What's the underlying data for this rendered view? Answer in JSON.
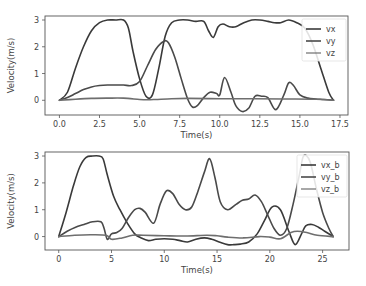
{
  "colors": {
    "vx": "#3a3a3a",
    "vy": "#4a4a4a",
    "vz": "#6e6e6e",
    "spine": "#555555",
    "text": "#444444"
  },
  "chart_data": [
    {
      "type": "line",
      "title": "",
      "xlabel": "Time(s)",
      "ylabel": "Velocity(m/s)",
      "xlim": [
        -0.9,
        18.0
      ],
      "ylim": [
        -0.55,
        3.15
      ],
      "xticks": [
        0.0,
        2.5,
        5.0,
        7.5,
        10.0,
        12.5,
        15.0,
        17.5
      ],
      "xtick_labels": [
        "0.0",
        "2.5",
        "5.0",
        "7.5",
        "10.0",
        "12.5",
        "15.0",
        "17.5"
      ],
      "yticks": [
        0,
        1,
        2,
        3
      ],
      "ytick_labels": [
        "0",
        "1",
        "2",
        "3"
      ],
      "grid": false,
      "legend_position": "upper right",
      "frame": {
        "left": 45,
        "top": 16,
        "right": 348,
        "bottom": 115
      },
      "series": [
        {
          "name": "vx",
          "x": [
            0,
            0.5,
            1.0,
            1.5,
            2.0,
            2.5,
            3.0,
            3.5,
            4.0,
            4.3,
            4.6,
            5.0,
            5.4,
            5.8,
            6.2,
            6.6,
            7.0,
            7.5,
            8.0,
            8.5,
            9.0,
            9.3,
            9.6,
            9.9,
            10.2,
            10.6,
            11.0,
            11.5,
            12.0,
            12.5,
            13.0,
            13.4,
            13.8,
            14.3,
            14.8,
            15.3,
            15.8,
            16.3,
            16.8,
            17.1
          ],
          "values": [
            0,
            0.3,
            1.2,
            2.0,
            2.6,
            2.9,
            3.0,
            3.0,
            3.0,
            2.7,
            1.8,
            0.8,
            0.15,
            0.2,
            1.2,
            2.4,
            2.9,
            3.0,
            3.0,
            2.95,
            2.95,
            2.6,
            2.35,
            2.75,
            2.85,
            2.75,
            2.75,
            2.9,
            3.0,
            3.0,
            2.95,
            2.9,
            2.9,
            3.0,
            2.9,
            2.7,
            2.1,
            1.2,
            0.3,
            0
          ]
        },
        {
          "name": "vy",
          "x": [
            0,
            0.5,
            1.0,
            1.5,
            2.0,
            2.5,
            3.0,
            3.5,
            4.0,
            4.5,
            5.0,
            5.5,
            6.0,
            6.5,
            6.8,
            7.2,
            7.6,
            8.0,
            8.3,
            8.6,
            9.0,
            9.4,
            9.8,
            10.0,
            10.3,
            10.7,
            11.0,
            11.4,
            11.8,
            12.2,
            12.6,
            13.0,
            13.5,
            14.0,
            14.3,
            14.6,
            15.0,
            15.5,
            16.0,
            16.5,
            17.1
          ],
          "values": [
            0,
            0.1,
            0.25,
            0.4,
            0.5,
            0.55,
            0.57,
            0.57,
            0.57,
            0.55,
            0.7,
            1.3,
            1.9,
            2.2,
            2.15,
            1.6,
            0.8,
            0.05,
            -0.25,
            -0.2,
            0.1,
            0.3,
            0.25,
            0.2,
            0.85,
            0.3,
            -0.2,
            -0.42,
            -0.3,
            0.15,
            0.15,
            0.1,
            -0.35,
            0.2,
            0.65,
            0.55,
            0.2,
            0.08,
            0.05,
            0.03,
            0
          ]
        },
        {
          "name": "vz",
          "x": [
            0,
            1.0,
            2.0,
            3.0,
            4.0,
            5.0,
            5.5,
            6.0,
            7.0,
            8.0,
            10.0,
            12.0,
            14.0,
            16.0,
            17.1
          ],
          "values": [
            0,
            0.04,
            0.07,
            0.08,
            0.08,
            0.03,
            0.02,
            0.03,
            0.06,
            0.07,
            0.06,
            0.06,
            0.05,
            0.04,
            0
          ]
        }
      ]
    },
    {
      "type": "line",
      "title": "",
      "xlabel": "Time(s)",
      "ylabel": "Velocity(m/s)",
      "xlim": [
        -1.3,
        27.5
      ],
      "ylim": [
        -0.5,
        3.15
      ],
      "xticks": [
        0,
        5,
        10,
        15,
        20,
        25
      ],
      "xtick_labels": [
        "0",
        "5",
        "10",
        "15",
        "20",
        "25"
      ],
      "yticks": [
        0,
        1,
        2,
        3
      ],
      "ytick_labels": [
        "0",
        "1",
        "2",
        "3"
      ],
      "grid": false,
      "legend_position": "upper right",
      "frame": {
        "left": 45,
        "top": 152,
        "right": 349,
        "bottom": 250
      },
      "series": [
        {
          "name": "vx_b",
          "x": [
            0,
            0.7,
            1.4,
            2.0,
            2.6,
            3.2,
            3.8,
            4.2,
            4.6,
            5.2,
            5.8,
            6.5,
            7.2,
            7.8,
            8.5,
            9.2,
            10.0,
            10.8,
            11.5,
            12.2,
            13.0,
            13.8,
            14.5,
            15.2,
            16.0,
            16.6,
            17.2,
            18.0,
            18.8,
            19.5,
            20.2,
            21.0,
            21.8,
            22.4,
            23.0,
            23.4,
            24.0,
            24.6,
            25.2,
            26.0
          ],
          "values": [
            0,
            0.9,
            1.9,
            2.6,
            2.95,
            3.0,
            3.0,
            2.9,
            2.3,
            1.5,
            1.0,
            0.5,
            0.1,
            -0.05,
            -0.15,
            -0.1,
            -0.08,
            -0.1,
            -0.15,
            -0.2,
            -0.1,
            -0.05,
            -0.1,
            -0.2,
            -0.3,
            -0.3,
            -0.28,
            -0.2,
            0.1,
            0.6,
            1.1,
            1.0,
            0.2,
            -0.3,
            0.1,
            0.4,
            0.45,
            0.35,
            0.2,
            0
          ]
        },
        {
          "name": "vy_b",
          "x": [
            0,
            0.8,
            1.6,
            2.4,
            3.2,
            4.0,
            4.3,
            4.6,
            5.0,
            5.5,
            6.0,
            6.6,
            7.2,
            7.7,
            8.2,
            9.0,
            9.6,
            10.2,
            10.8,
            11.4,
            12.0,
            12.6,
            13.2,
            13.8,
            14.3,
            14.8,
            15.3,
            16.0,
            16.8,
            17.4,
            18.0,
            18.6,
            19.2,
            19.8,
            20.4,
            21.0,
            21.6,
            22.2,
            22.8,
            23.2,
            23.8,
            24.4,
            25.0,
            25.6,
            26.0
          ],
          "values": [
            0,
            0.2,
            0.35,
            0.45,
            0.55,
            0.55,
            0.3,
            -0.1,
            0.1,
            0.15,
            0.3,
            0.7,
            1.0,
            1.05,
            0.9,
            0.5,
            1.2,
            1.7,
            1.6,
            1.2,
            1.0,
            1.1,
            1.7,
            2.4,
            2.9,
            2.2,
            1.3,
            1.0,
            1.2,
            1.35,
            1.4,
            1.55,
            1.3,
            0.8,
            0.3,
            0.05,
            0.3,
            1.2,
            2.3,
            3.0,
            2.8,
            1.8,
            0.9,
            0.3,
            0
          ]
        },
        {
          "name": "vz_b",
          "x": [
            0,
            1.5,
            3.0,
            4.5,
            5.0,
            6.0,
            7.0,
            8.0,
            10.0,
            12.0,
            14.0,
            15.0,
            16.0,
            17.5,
            19.0,
            20.0,
            21.0,
            22.0,
            22.6,
            23.5,
            24.5,
            26.0
          ],
          "values": [
            0,
            0.05,
            0.07,
            0.05,
            -0.1,
            -0.05,
            0.05,
            0.05,
            0.03,
            0.02,
            0.05,
            0.03,
            -0.02,
            -0.05,
            0.0,
            -0.02,
            -0.08,
            0.15,
            0.2,
            0.15,
            0.05,
            0
          ]
        }
      ]
    }
  ]
}
